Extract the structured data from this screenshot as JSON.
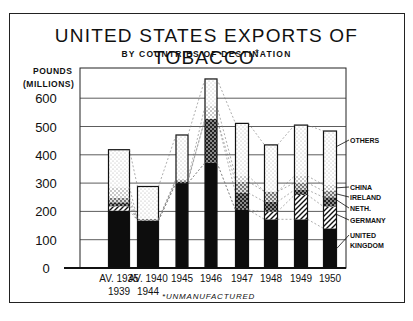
{
  "chart_data": {
    "type": "bar",
    "stacked": true,
    "title": "UNITED STATES EXPORTS OF TOBACCO*",
    "subtitle": "BY COUNTRIES OF DESTINATION",
    "ylabel": "POUNDS (MILLIONS)",
    "xlabel": "",
    "ylim": [
      0,
      650
    ],
    "yticks": [
      0,
      100,
      200,
      300,
      400,
      500,
      600
    ],
    "grid": true,
    "legend_position": "right (annotated labels)",
    "footnote": "*UNMANUFACTURED",
    "categories": [
      "AV. 1935-1939",
      "AV. 1940-1944",
      "1945",
      "1946",
      "1947",
      "1948",
      "1949",
      "1950"
    ],
    "category_labels": [
      [
        "AV. 1935",
        "1939"
      ],
      [
        "AV. 1940",
        "1944"
      ],
      [
        "1945"
      ],
      [
        "1946"
      ],
      [
        "1947"
      ],
      [
        "1948"
      ],
      [
        "1949"
      ],
      [
        "1950"
      ]
    ],
    "series": [
      {
        "name": "UNITED KINGDOM",
        "pattern": "solid-black",
        "values": [
          203,
          168,
          300,
          372,
          205,
          172,
          172,
          140
        ]
      },
      {
        "name": "GERMANY",
        "pattern": "diagonal-hatch",
        "values": [
          15,
          0,
          0,
          0,
          0,
          27,
          86,
          77
        ]
      },
      {
        "name": "NETH.",
        "pattern": "cross-hatch",
        "values": [
          14,
          0,
          5,
          155,
          60,
          35,
          18,
          33
        ]
      },
      {
        "name": "IRELAND",
        "pattern": "dense-dots",
        "values": [
          16,
          5,
          5,
          0,
          40,
          36,
          25,
          22
        ]
      },
      {
        "name": "CHINA",
        "pattern": "light-dots",
        "values": [
          37,
          0,
          5,
          45,
          20,
          0,
          24,
          22
        ]
      },
      {
        "name": "OTHERS",
        "pattern": "fine-stipple",
        "values": [
          133,
          115,
          155,
          96,
          186,
          165,
          180,
          190
        ]
      }
    ],
    "totals": [
      418,
      288,
      470,
      668,
      511,
      435,
      505,
      484
    ]
  },
  "labels": {
    "title": "UNITED STATES EXPORTS OF TOBACCO",
    "title_mark": "*",
    "subtitle": "BY COUNTRIES OF DESTINATION",
    "ylabel_line1": "POUNDS",
    "ylabel_line2": "(MILLIONS)",
    "footnote": "*UNMANUFACTURED",
    "legend": [
      "OTHERS",
      "CHINA",
      "IRELAND",
      "NETH.",
      "GERMANY",
      "UNITED",
      "KINGDOM"
    ]
  }
}
